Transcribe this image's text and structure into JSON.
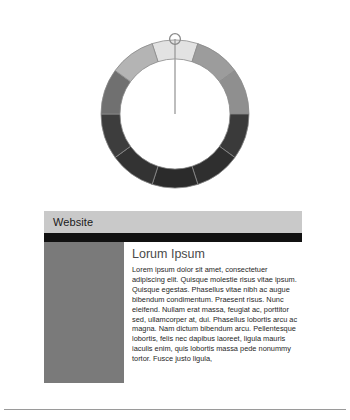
{
  "gauge": {
    "name": "segmented-donut-gauge",
    "pointer_value_index": 0,
    "pointer_label": "top",
    "center_marker": "circle",
    "segment_count": 10,
    "segments": [
      {
        "label": "segment-1",
        "start_angle": -18,
        "end_angle": 18,
        "color": "#e2e2e2"
      },
      {
        "label": "segment-2",
        "start_angle": 18,
        "end_angle": 54,
        "color": "#9c9c9c"
      },
      {
        "label": "segment-3",
        "start_angle": 54,
        "end_angle": 90,
        "color": "#8f8f8f"
      },
      {
        "label": "segment-4",
        "start_angle": 90,
        "end_angle": 126,
        "color": "#3a3a3a"
      },
      {
        "label": "segment-5",
        "start_angle": 126,
        "end_angle": 162,
        "color": "#2f2f2f"
      },
      {
        "label": "segment-6",
        "start_angle": 162,
        "end_angle": 198,
        "color": "#2b2b2b"
      },
      {
        "label": "segment-7",
        "start_angle": 198,
        "end_angle": 234,
        "color": "#333333"
      },
      {
        "label": "segment-8",
        "start_angle": 234,
        "end_angle": 270,
        "color": "#3d3d3d"
      },
      {
        "label": "segment-9",
        "start_angle": 270,
        "end_angle": 306,
        "color": "#707070"
      },
      {
        "label": "segment-10",
        "start_angle": 306,
        "end_angle": 342,
        "color": "#b4b4b4"
      }
    ],
    "stroke_color": "#8a8a8a",
    "needle_color": "#9a9a9a"
  },
  "website": {
    "title": "Website",
    "titlebar_color": "#c9c9c9",
    "navbar_color": "#111111",
    "sidebar_color": "#7a7a7a",
    "heading": "Lorum Ipsum",
    "heading_color": "#4a4a4a",
    "paragraph": "Lorem ipsum dolor sit amet, consectetuer adipiscing elit. Quisque molestie risus vitae ipsum. Quisque egestas. Phasellus vitae nibh ac augue bibendum condimentum. Praesent risus. Nunc eleifend. Nullam erat massa, feugiat ac, porttitor sed, ullamcorper at, dui. Phasellus lobortis arcu ac magna. Nam dictum bibendum arcu. Pellentesque lobortis, felis nec dapibus laoreet, ligula mauris iaculis enim, quis lobortis massa pede nonummy tortor. Fusce justo ligula,"
  },
  "divider": {
    "name": "bottom-rule",
    "color": "#9a9a9a"
  }
}
